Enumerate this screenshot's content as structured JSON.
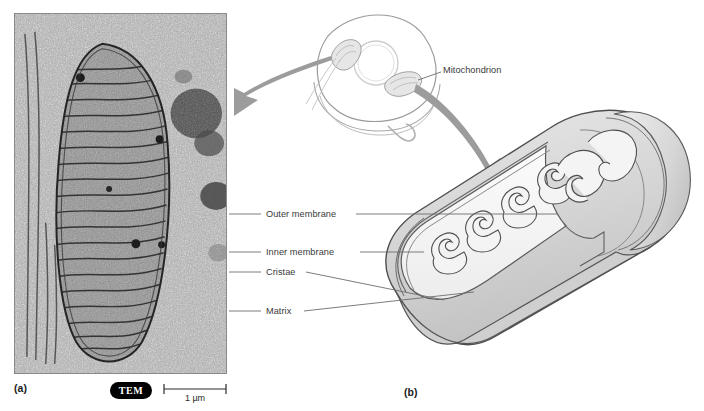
{
  "figure": {
    "panels": [
      {
        "letter": "(a)",
        "kind": "transmission-electron-micrograph"
      },
      {
        "letter": "(b)",
        "kind": "three-dimensional-cutaway-diagram"
      }
    ]
  },
  "micrograph": {
    "technique_badge": "TEM",
    "scale_bar_label": "1 µm",
    "subject": "mitochondrion-electron-micrograph",
    "panel_letter": "(a)"
  },
  "diagram": {
    "panel_letter": "(b)",
    "cell_overview": {
      "name": "eukaryotic-cell-outline",
      "organelles": [
        "mitochondrion",
        "mitochondrion"
      ],
      "nucleus": "nucleus"
    },
    "labels": [
      {
        "id": "mitochondrion",
        "text": "Mitochondrion"
      },
      {
        "id": "outer_membrane",
        "text": "Outer membrane"
      },
      {
        "id": "inner_membrane",
        "text": "Inner membrane"
      },
      {
        "id": "cristae",
        "text": "Cristae"
      },
      {
        "id": "matrix",
        "text": "Matrix"
      }
    ],
    "arrows": [
      {
        "id": "arrow-left",
        "direction": "down-left"
      },
      {
        "id": "arrow-right",
        "direction": "down-right"
      }
    ]
  },
  "colors": {
    "ink": "#333333",
    "outline": "#5a5a5a",
    "arrow_gray": "#9a9a9a",
    "membrane_fill": "#d8d8d8",
    "matrix_fill": "#f2f2f2",
    "badge_bg": "#000000",
    "badge_text": "#ffffff"
  }
}
